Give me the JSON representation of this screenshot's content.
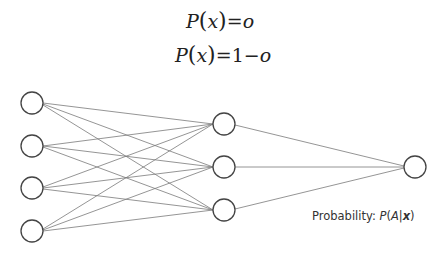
{
  "formulas": {
    "f1": {
      "lhs_func": "P",
      "lhs_arg": "x",
      "equals": "=",
      "rhs": "o"
    },
    "f2": {
      "lhs_func": "P",
      "lhs_arg": "x",
      "equals": "=",
      "rhs_num": "1",
      "rhs_op": "−",
      "rhs_var": "o"
    }
  },
  "network": {
    "layers": [
      {
        "name": "input",
        "count": 4
      },
      {
        "name": "hidden",
        "count": 3
      },
      {
        "name": "output",
        "count": 1
      }
    ],
    "node_color": "#444444",
    "edge_color": "#777777"
  },
  "output_label": {
    "prefix": "Probability: ",
    "func": "P",
    "open": "(",
    "event": "A",
    "bar": "|",
    "given": "x",
    "close": ")"
  }
}
